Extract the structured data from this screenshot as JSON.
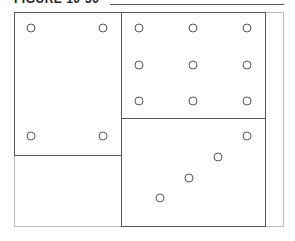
{
  "figure": {
    "title": "FIGURE 10-30"
  },
  "panels": [
    {
      "name": "left-top-panel",
      "holes": [
        [
          31,
          28
        ],
        [
          103,
          28
        ],
        [
          31,
          136
        ],
        [
          103,
          136
        ]
      ]
    },
    {
      "name": "right-top-panel",
      "holes": [
        [
          139,
          28
        ],
        [
          193,
          28
        ],
        [
          247,
          28
        ],
        [
          139,
          65
        ],
        [
          193,
          65
        ],
        [
          247,
          65
        ],
        [
          139,
          101
        ],
        [
          193,
          101
        ],
        [
          247,
          101
        ]
      ]
    },
    {
      "name": "right-bottom-panel",
      "holes": [
        [
          247,
          136
        ],
        [
          218,
          157
        ],
        [
          189,
          178
        ],
        [
          160,
          198
        ]
      ]
    }
  ]
}
